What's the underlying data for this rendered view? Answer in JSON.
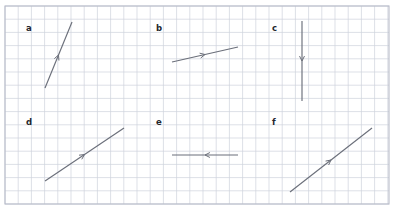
{
  "figure": {
    "width": 394,
    "height": 210,
    "background_color": "#ffffff"
  },
  "grid": {
    "cell_size": 13.2,
    "columns": 29,
    "rows": 15,
    "line_color": "#cfd2dd",
    "border_color": "#b9bcc9",
    "x0": 5,
    "y0": 6,
    "x1": 389,
    "y1": 204
  },
  "style": {
    "vector_color": "#6b6f7a",
    "label_color": "#23262e"
  },
  "chart_data": {
    "type": "diagram",
    "xlabel": "",
    "ylabel": "",
    "grid": true,
    "grid_cell_px": 13.2,
    "legend": "none",
    "vectors": [
      {
        "label": "a",
        "label_x": 26,
        "label_y": 24,
        "x1": 45,
        "y1": 88,
        "x2": 72,
        "y2": 22,
        "dx_cells": 2,
        "dy_cells": -5,
        "direction": "up-right-steep",
        "arrow_position": "midpoint",
        "arrow_points": "forward"
      },
      {
        "label": "b",
        "label_x": 156,
        "label_y": 24,
        "x1": 172,
        "y1": 62,
        "x2": 238,
        "y2": 47,
        "dx_cells": 5,
        "dy_cells": -1,
        "direction": "right-shallow-up",
        "arrow_position": "midpoint",
        "arrow_points": "forward"
      },
      {
        "label": "c",
        "label_x": 272,
        "label_y": 24,
        "x1": 302,
        "y1": 21,
        "x2": 302,
        "y2": 101,
        "dx_cells": 0,
        "dy_cells": 6,
        "direction": "down",
        "arrow_position": "midpoint",
        "arrow_points": "forward"
      },
      {
        "label": "d",
        "label_x": 26,
        "label_y": 118,
        "x1": 45,
        "y1": 181,
        "x2": 124,
        "y2": 128,
        "dx_cells": 6,
        "dy_cells": -4,
        "direction": "up-right-diagonal",
        "arrow_position": "midpoint",
        "arrow_points": "forward"
      },
      {
        "label": "e",
        "label_x": 156,
        "label_y": 118,
        "x1": 238,
        "y1": 155,
        "x2": 172,
        "y2": 155,
        "dx_cells": -5,
        "dy_cells": 0,
        "direction": "left",
        "arrow_position": "midpoint",
        "arrow_points": "forward"
      },
      {
        "label": "f",
        "label_x": 272,
        "label_y": 118,
        "x1": 290,
        "y1": 192,
        "x2": 372,
        "y2": 128,
        "dx_cells": 6,
        "dy_cells": -5,
        "direction": "up-right-diagonal",
        "arrow_position": "midpoint",
        "arrow_points": "forward"
      }
    ]
  }
}
